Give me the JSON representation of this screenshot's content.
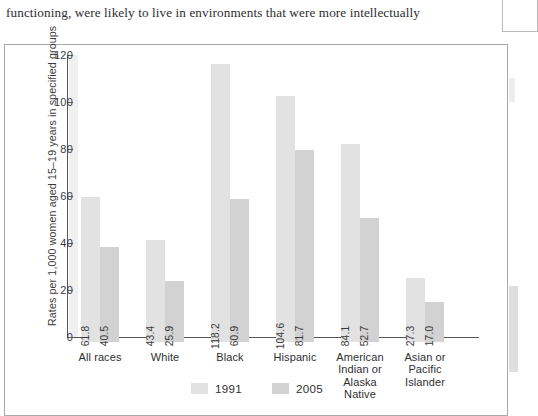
{
  "page": {
    "body_text": "functioning, were likely to live in environments that were more intellectually"
  },
  "chart_data": {
    "type": "bar",
    "title": "",
    "xlabel": "",
    "ylabel": "Rates per 1,000 women aged 15–19 years in specified groups",
    "ylim": [
      0,
      120
    ],
    "yticks": [
      "0",
      "20",
      "40",
      "60",
      "80",
      "100",
      "120"
    ],
    "grid": false,
    "legend_position": "bottom-center",
    "categories": [
      "All races",
      "White",
      "Black",
      "Hispanic",
      "American Indian or Alaska Native",
      "Asian or Pacific Islander"
    ],
    "category_lines": [
      [
        "All races"
      ],
      [
        "White"
      ],
      [
        "Black"
      ],
      [
        "Hispanic"
      ],
      [
        "American",
        "Indian or",
        "Alaska",
        "Native"
      ],
      [
        "Asian or",
        "Pacific",
        "Islander"
      ]
    ],
    "series": [
      {
        "name": "1991",
        "color": "#e2e2e2",
        "values": [
          61.8,
          43.4,
          118.2,
          104.6,
          84.1,
          27.3
        ],
        "labels": [
          "61.8",
          "43.4",
          "118.2",
          "104.6",
          "84.1",
          "27.3"
        ]
      },
      {
        "name": "2005",
        "color": "#d2d2d2",
        "values": [
          40.5,
          25.9,
          60.9,
          81.7,
          52.7,
          17.0
        ],
        "labels": [
          "40.5",
          "25.9",
          "60.9",
          "81.7",
          "52.7",
          "17.0"
        ]
      }
    ],
    "legend": [
      "1991",
      "2005"
    ]
  }
}
